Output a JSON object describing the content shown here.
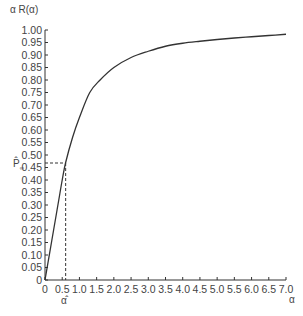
{
  "chart_data": {
    "type": "line",
    "title": "",
    "ylabel": "α R(α)",
    "xlabel": "α",
    "xlim": [
      0,
      7.0
    ],
    "ylim": [
      0,
      1.0
    ],
    "grid": false,
    "legend": null,
    "x_ticks": [
      "0",
      "0.5",
      "1.0",
      "1.5",
      "2.0",
      "2.5",
      "3.0",
      "3.5",
      "4.0",
      "4.5",
      "5.0",
      "5.5",
      "6.0",
      "6.5",
      "7.0"
    ],
    "y_ticks": [
      "0",
      "0.05",
      "0.10",
      "0.15",
      "0.20",
      "0.25",
      "0.30",
      "0.35",
      "0.40",
      "0.45",
      "0.50",
      "0.55",
      "0.60",
      "0.65",
      "0.70",
      "0.75",
      "0.80",
      "0.85",
      "0.90",
      "0.95",
      "1.00"
    ],
    "series": [
      {
        "name": "R(α)",
        "x": [
          0,
          0.1,
          0.2,
          0.3,
          0.4,
          0.5,
          0.6,
          0.8,
          1.0,
          1.3,
          1.6,
          2.0,
          2.5,
          3.0,
          3.5,
          4.0,
          4.5,
          5.0,
          5.5,
          6.0,
          6.5,
          7.0
        ],
        "y": [
          0,
          0.08,
          0.16,
          0.24,
          0.32,
          0.4,
          0.47,
          0.57,
          0.65,
          0.75,
          0.8,
          0.85,
          0.89,
          0.915,
          0.935,
          0.947,
          0.955,
          0.962,
          0.968,
          0.973,
          0.978,
          0.983
        ]
      }
    ],
    "annotations": [
      {
        "type": "dashed-hline",
        "y": 0.468,
        "label": "P̂∞",
        "from_x": 0,
        "to_x": 0.6
      },
      {
        "type": "dashed-vline",
        "x": 0.6,
        "label": "α̂",
        "from_y": 0,
        "to_y": 0.468
      }
    ]
  },
  "labels": {
    "y_axis_title": "α R(α)",
    "x_axis_title": "α",
    "p_hat_label": "P̂",
    "p_hat_sub": "∞",
    "alpha_hat_label": "α̂"
  }
}
